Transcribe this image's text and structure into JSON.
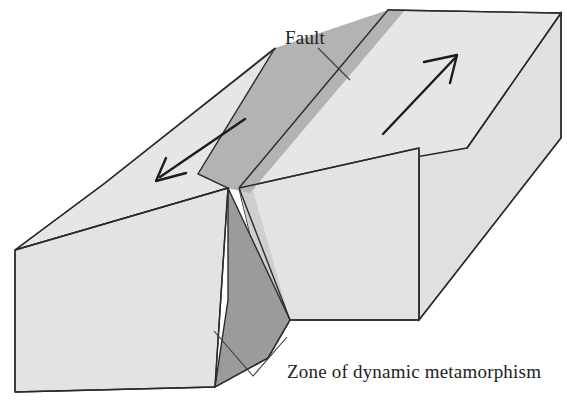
{
  "labels": {
    "fault": "Fault",
    "zone": "Zone of dynamic metamorphism"
  },
  "colors": {
    "block_top_light": "#e6e6e6",
    "block_front_light": "#e3e3e3",
    "block_side_light": "#e0e0e0",
    "fault_band_mid": "#b3b3b3",
    "fault_zone_dark": "#9b9b9b",
    "outline": "#2b2b2b",
    "arrow": "#1c1c1c",
    "leader": "#3a3a3a",
    "background": "#ffffff",
    "text": "#222222"
  },
  "geometry": {
    "left_block": {
      "top_face": "15,250 105,183 275,48 385,92 227,188 227,188",
      "front_face": "15,250 15,392 215,387 228,300 228,188",
      "note": "near block, displaced toward lower-left"
    },
    "right_block": {
      "top_face": "388,10 561,13 467,148 239,188",
      "front_face": "239,188 419,320 419,148",
      "side_face": "467,148 561,13 561,138 419,320",
      "note": "far block, displaced toward upper-right"
    },
    "fault_plane": {
      "surface_band": "275,48 385,92 227,188 198,174",
      "zone_face": "228,188 228,300 215,387 268,358 268,240",
      "note": "darker gray face of the dynamic metamorphism zone"
    }
  },
  "arrows": [
    {
      "name": "left-block-motion-arrow",
      "direction": "down-left",
      "from": [
        245,
        120
      ],
      "to": [
        153,
        182
      ],
      "meaning": "left block moves toward viewer / southwest"
    },
    {
      "name": "right-block-motion-arrow",
      "direction": "up-right",
      "from": [
        384,
        133
      ],
      "to": [
        458,
        55
      ],
      "meaning": "right block moves away / northeast"
    }
  ],
  "leaders": [
    {
      "name": "fault-leader-line",
      "points": "319,48 349,79",
      "target": "fault plane trace on top surface"
    },
    {
      "name": "zone-leader-line-left",
      "points": "253,375 215,332",
      "target": "dark fault zone face"
    },
    {
      "name": "zone-leader-line-right",
      "points": "253,375 286,338",
      "target": "fault band on right block front"
    }
  ]
}
